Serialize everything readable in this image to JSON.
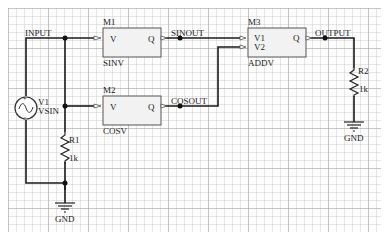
{
  "schematic": {
    "nets": {
      "input": "INPUT",
      "sinout": "SINOUT",
      "cosout": "COSOUT",
      "output": "OUTPUT"
    },
    "components": {
      "m1": {
        "ref": "M1",
        "model": "SINV",
        "pin_in": "V",
        "pin_out": "Q"
      },
      "m2": {
        "ref": "M2",
        "model": "COSV",
        "pin_in": "V",
        "pin_out": "Q"
      },
      "m3": {
        "ref": "M3",
        "model": "ADDV",
        "pin_in1": "V1",
        "pin_in2": "V2",
        "pin_out": "Q"
      },
      "v1": {
        "ref": "V1",
        "model": "VSIN"
      },
      "r1": {
        "ref": "R1",
        "value": "1k"
      },
      "r2": {
        "ref": "R2",
        "value": "1k"
      },
      "gnd1": {
        "label": "GND"
      },
      "gnd2": {
        "label": "GND"
      }
    },
    "colors": {
      "wire": "#1a1a1a",
      "block_fill": "#f2f2f2",
      "block_border": "#555555",
      "grid_minor": "#d0d0d0",
      "grid_major": "#a8a8a8"
    }
  }
}
